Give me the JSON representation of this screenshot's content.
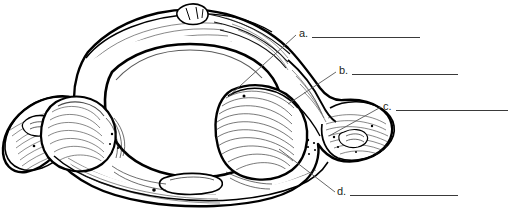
{
  "page": {
    "width": 514,
    "height": 222,
    "background_color": "#ffffff"
  },
  "figure": {
    "name": "cervical-vertebra-superior-view",
    "line_color": "#000000",
    "fill_color": "#ffffff",
    "shading_color": "#1a1a1a"
  },
  "labels": [
    {
      "id": "a",
      "letter": "a.",
      "answer": "",
      "leader_from_x": 229,
      "leader_from_y": 96,
      "leader_to_x": 296,
      "leader_to_y": 35,
      "rule_width": 108
    },
    {
      "id": "b",
      "letter": "b.",
      "answer": "",
      "leader_from_x": 288,
      "leader_from_y": 104,
      "leader_to_x": 336,
      "leader_to_y": 72,
      "rule_width": 106
    },
    {
      "id": "c",
      "letter": "c.",
      "answer": "",
      "leader_from_x": 329,
      "leader_from_y": 136,
      "leader_to_x": 381,
      "leader_to_y": 107,
      "rule_width": 112
    },
    {
      "id": "d",
      "letter": "d.",
      "answer": "",
      "leader_from_x": 279,
      "leader_from_y": 149,
      "leader_to_x": 335,
      "leader_to_y": 192,
      "rule_width": 108
    }
  ]
}
